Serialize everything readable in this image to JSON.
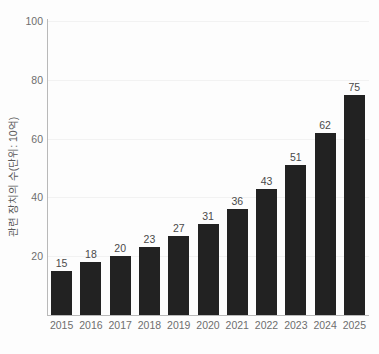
{
  "chart_data": {
    "type": "bar",
    "title": "",
    "subtitle": "",
    "xlabel": "",
    "ylabel": "관련 장치의 수(단위: 10억)",
    "categories": [
      "2015",
      "2016",
      "2017",
      "2018",
      "2019",
      "2020",
      "2021",
      "2022",
      "2023",
      "2024",
      "2025"
    ],
    "values": [
      15,
      18,
      20,
      23,
      27,
      31,
      36,
      43,
      51,
      62,
      75
    ],
    "series": [
      {
        "name": "관련 장치의 수",
        "values": [
          15,
          18,
          20,
          23,
          27,
          31,
          36,
          43,
          51,
          62,
          75
        ]
      }
    ],
    "data_labels": [
      "15",
      "18",
      "20",
      "23",
      "27",
      "31",
      "36",
      "43",
      "51",
      "62",
      "75"
    ],
    "ylim": [
      0,
      100
    ],
    "y_ticks": [
      20,
      40,
      60,
      80,
      100
    ],
    "y_tick_labels": [
      "20",
      "40",
      "60",
      "80",
      "100"
    ],
    "grid": true,
    "legend": "none",
    "bar_color": "#222222",
    "axis_color": "#b9b9b9",
    "grid_color": "#f2f2f2",
    "label_color": "#6e6e6e",
    "background_color": "#fdfdfd"
  }
}
